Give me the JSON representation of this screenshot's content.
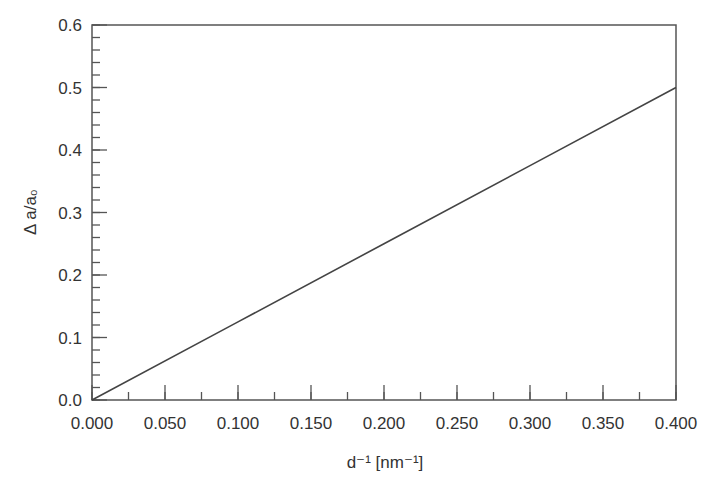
{
  "chart_data": {
    "type": "line",
    "title": "",
    "xlabel": "d⁻¹ [nm⁻¹]",
    "ylabel": "Δ a/a₀",
    "xlim": [
      0.0,
      0.4
    ],
    "ylim": [
      0.0,
      0.6
    ],
    "grid": false,
    "legend": null,
    "x_ticks": [
      "0.000",
      "0.050",
      "0.100",
      "0.150",
      "0.200",
      "0.250",
      "0.300",
      "0.350",
      "0.400"
    ],
    "y_ticks": [
      "0.0",
      "0.1",
      "0.2",
      "0.3",
      "0.4",
      "0.5",
      "0.6"
    ],
    "x_minor_step": 0.025,
    "y_minor_step": 0.02,
    "series": [
      {
        "name": "Δ a/a₀",
        "x": [
          0.0,
          0.1,
          0.2,
          0.3,
          0.4
        ],
        "y": [
          0.0,
          0.125,
          0.25,
          0.375,
          0.5
        ]
      }
    ]
  },
  "colors": {
    "axis": "#555555",
    "line": "#444444",
    "text": "#333333"
  }
}
